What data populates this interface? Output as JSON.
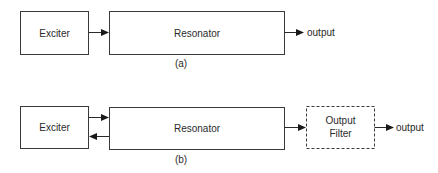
{
  "diagram_a": {
    "caption": "(a)",
    "nodes": [
      {
        "id": "exciter",
        "label": "Exciter",
        "style": "solid"
      },
      {
        "id": "resonator",
        "label": "Resonator",
        "style": "solid"
      }
    ],
    "edges": [
      {
        "from": "exciter",
        "to": "resonator",
        "direction": "forward"
      },
      {
        "from": "resonator",
        "to": "output",
        "direction": "forward"
      }
    ],
    "output_label": "output"
  },
  "diagram_b": {
    "caption": "(b)",
    "nodes": [
      {
        "id": "exciter",
        "label": "Exciter",
        "style": "solid"
      },
      {
        "id": "resonator",
        "label": "Resonator",
        "style": "solid"
      },
      {
        "id": "output_filter",
        "label_line1": "Output",
        "label_line2": "Filter",
        "style": "dashed"
      }
    ],
    "edges": [
      {
        "from": "exciter",
        "to": "resonator",
        "direction": "forward"
      },
      {
        "from": "resonator",
        "to": "exciter",
        "direction": "backward"
      },
      {
        "from": "resonator",
        "to": "output_filter",
        "direction": "forward"
      },
      {
        "from": "output_filter",
        "to": "output",
        "direction": "forward"
      }
    ],
    "output_label": "output"
  },
  "colors": {
    "stroke": "#3a3a3a",
    "text": "#2a2a2a",
    "background": "#ffffff"
  }
}
